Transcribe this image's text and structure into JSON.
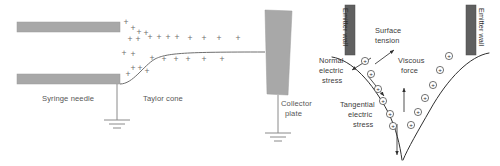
{
  "figure": {
    "panels": [
      "left-electrospinning-setup",
      "right-cone-force-balance"
    ],
    "background_color": "#ffffff"
  },
  "colors": {
    "needle_gray": "#a8a8a8",
    "plate_gray": "#a8a8a8",
    "wall_dark_gray": "#606060",
    "label_gray": "#4a4a4a",
    "line_gray": "#6f6f6f",
    "cone_line": "#2f2f2f",
    "plus_gray": "#6d6d6d"
  },
  "left_panel": {
    "name": "electrospinning-setup",
    "labels": {
      "syringe_needle": "Syringe needle",
      "taylor_cone": "Taylor cone",
      "collector_plate_line1": "Collector",
      "collector_plate_line2": "plate"
    },
    "charge_symbol": "+",
    "needle_top_bar": {
      "x": 17,
      "y": 22,
      "w": 103,
      "h": 10
    },
    "needle_bottom_bar": {
      "x": 17,
      "y": 74,
      "w": 103,
      "h": 10
    },
    "collector_plate_points": "265,10 292,11 288,95 267,94",
    "jet_path": "M 120,84 C 133,84 143,66 155,59 C 167,53 185,52 265,52",
    "ground_needle": {
      "x": 117,
      "y_top": 84,
      "y_bot": 120
    },
    "ground_plate": {
      "x": 278,
      "y_top": 95,
      "y_bot": 133
    },
    "plus_positions": [
      [
        126,
        25
      ],
      [
        133,
        31
      ],
      [
        139,
        35
      ],
      [
        146,
        36
      ],
      [
        130,
        42
      ],
      [
        138,
        42
      ],
      [
        124,
        56
      ],
      [
        133,
        57
      ],
      [
        150,
        40
      ],
      [
        159,
        40
      ],
      [
        168,
        40
      ],
      [
        177,
        40
      ],
      [
        190,
        41
      ],
      [
        204,
        41
      ],
      [
        219,
        41
      ],
      [
        152,
        61
      ],
      [
        164,
        62
      ],
      [
        176,
        62
      ],
      [
        188,
        62
      ],
      [
        204,
        62
      ],
      [
        222,
        62
      ],
      [
        238,
        41
      ],
      [
        133,
        71
      ],
      [
        140,
        71
      ],
      [
        147,
        74
      ],
      [
        128,
        77
      ]
    ]
  },
  "right_panel": {
    "name": "cone-force-balance",
    "labels": {
      "emitter_wall_left": "Emitter wall",
      "emitter_wall_right": "Emitter wall",
      "surface_tension_line1": "Surface",
      "surface_tension_line2": "tension",
      "viscous_force_line1": "Viscous",
      "viscous_force_line2": "force",
      "normal_stress_line1": "Normal",
      "normal_stress_line2": "electric",
      "normal_stress_line3": "stress",
      "tangential_stress_line1": "Tangential",
      "tangential_stress_line2": "electric",
      "tangential_stress_line3": "stress"
    },
    "charge_symbol": "+",
    "wall_left": {
      "x": 345,
      "y": 5,
      "w": 10,
      "h": 50
    },
    "wall_right": {
      "x": 466,
      "y": 5,
      "w": 10,
      "h": 50
    },
    "cone_left_path": "M 332,57 C 352,60 372,82 388,112 C 396,128 400,145 402,160",
    "cone_right_path": "M 489,53 C 470,56 448,78 430,110 C 418,131 408,148 403,160",
    "charges_left": [
      [
        365,
        61
      ],
      [
        371,
        74
      ],
      [
        378,
        89
      ],
      [
        383,
        101
      ],
      [
        390,
        114
      ],
      [
        393,
        126
      ]
    ],
    "charges_right": [
      [
        449,
        56
      ],
      [
        440,
        70
      ],
      [
        433,
        85
      ],
      [
        425,
        98
      ],
      [
        418,
        112
      ],
      [
        411,
        125
      ]
    ],
    "arrow_surface_tension": {
      "x1": 375,
      "y1": 64,
      "x2": 394,
      "y2": 50
    },
    "arrow_viscous_force": {
      "x1": 404,
      "y1": 112,
      "x2": 404,
      "y2": 88
    },
    "arrow_normal_stress": {
      "x1": 371,
      "y1": 58,
      "x2": 352,
      "y2": 70
    },
    "arrow_tangential_stress": {
      "x1": 368,
      "y1": 76,
      "x2": 384,
      "y2": 96
    },
    "arrow_jet_down": {
      "x1": 397,
      "y1": 124,
      "x2": 397,
      "y2": 155
    }
  }
}
